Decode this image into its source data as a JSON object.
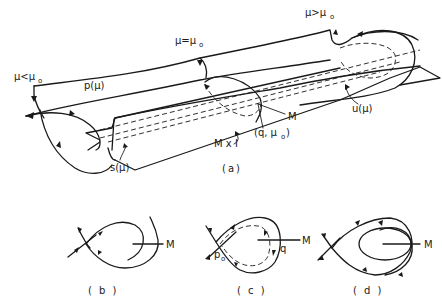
{
  "figure_a": {
    "caption": "(a)",
    "labels": {
      "mu_less": "μ<μ",
      "mu_less_sub": "o",
      "mu_equal": "μ=μ",
      "mu_equal_sub": "o",
      "mu_greater": "μ>μ",
      "mu_greater_sub": "o",
      "p_mu": "p(μ)",
      "u_mu": "u(μ)",
      "s_mu": "s(μ)",
      "q_mu0": "(q, μ",
      "q_mu0_sub": "o",
      "q_mu0_close": ")",
      "M": "M",
      "MxI": "M x I"
    }
  },
  "figure_b": {
    "caption": "( b )",
    "labels": {
      "M": "M"
    }
  },
  "figure_c": {
    "caption": "( c )",
    "labels": {
      "M": "M",
      "q": "q",
      "p0": "p",
      "p0_sub": "o"
    }
  },
  "figure_d": {
    "caption": "( d )",
    "labels": {
      "M": "M"
    }
  }
}
